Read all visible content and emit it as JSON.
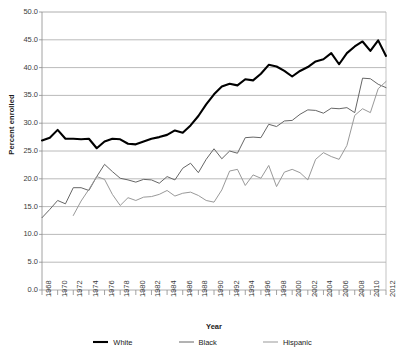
{
  "chart_data": {
    "type": "line",
    "title": "",
    "xlabel": "Year",
    "ylabel": "Percent enrolled",
    "xlim": [
      1968,
      2012
    ],
    "ylim": [
      0.0,
      50.0
    ],
    "ytick_step": 5.0,
    "xtick_step": 1,
    "xlabel_step": 2,
    "grid": "horizontal",
    "legend_position": "bottom",
    "ytick_labels": [
      "50.0",
      "45.0",
      "40.0",
      "35.0",
      "30.0",
      "25.0",
      "20.0",
      "15.0",
      "10.0",
      "5.0",
      "0.0"
    ],
    "xtick_labels": [
      "1968",
      "1970",
      "1972",
      "1974",
      "1976",
      "1978",
      "1980",
      "1982",
      "1984",
      "1986",
      "1988",
      "1990",
      "1992",
      "1994",
      "1996",
      "1998",
      "2000",
      "2002",
      "2004",
      "2006",
      "2008",
      "2010",
      "2012"
    ],
    "x": [
      1968,
      1969,
      1970,
      1971,
      1972,
      1973,
      1974,
      1975,
      1976,
      1977,
      1978,
      1979,
      1980,
      1981,
      1982,
      1983,
      1984,
      1985,
      1986,
      1987,
      1988,
      1989,
      1990,
      1991,
      1992,
      1993,
      1994,
      1995,
      1996,
      1997,
      1998,
      1999,
      2000,
      2001,
      2002,
      2003,
      2004,
      2005,
      2006,
      2007,
      2008,
      2009,
      2010,
      2011,
      2012
    ],
    "series": [
      {
        "name": "White",
        "color": "#000000",
        "width": 2.1,
        "values": [
          26.9,
          27.4,
          28.8,
          27.2,
          27.2,
          27.1,
          27.2,
          25.5,
          26.7,
          27.2,
          27.1,
          26.3,
          26.2,
          26.7,
          27.2,
          27.5,
          27.9,
          28.7,
          28.3,
          29.6,
          31.3,
          33.4,
          35.2,
          36.6,
          37.1,
          36.8,
          37.9,
          37.7,
          38.9,
          40.5,
          40.2,
          39.4,
          38.4,
          39.4,
          40.1,
          41.1,
          41.5,
          42.6,
          40.6,
          42.6,
          43.8,
          44.7,
          43.0,
          44.9,
          42.1
        ]
      },
      {
        "name": "Black",
        "color": "#666666",
        "width": 1.0,
        "values": [
          13.0,
          14.5,
          16.1,
          15.5,
          18.4,
          18.4,
          17.9,
          20.4,
          22.6,
          21.3,
          20.1,
          19.8,
          19.4,
          19.9,
          19.8,
          19.2,
          20.4,
          19.8,
          21.9,
          22.8,
          21.1,
          23.5,
          25.4,
          23.6,
          25.0,
          24.6,
          27.4,
          27.5,
          27.4,
          29.8,
          29.4,
          30.4,
          30.5,
          31.6,
          32.4,
          32.3,
          31.8,
          32.7,
          32.6,
          32.8,
          31.9,
          38.1,
          38.0,
          37.0,
          36.4
        ]
      },
      {
        "name": "Hispanic",
        "color": "#999999",
        "width": 1.0,
        "values": [
          null,
          null,
          null,
          null,
          13.4,
          16.0,
          18.1,
          20.4,
          19.9,
          17.2,
          15.2,
          16.6,
          16.1,
          16.7,
          16.8,
          17.2,
          17.9,
          16.9,
          17.4,
          17.6,
          17.0,
          16.1,
          15.8,
          18.0,
          21.4,
          21.7,
          18.8,
          20.7,
          20.1,
          22.4,
          18.6,
          21.2,
          21.7,
          21.1,
          19.8,
          23.5,
          24.7,
          24.0,
          23.5,
          26.0,
          31.4,
          32.6,
          31.9,
          36.2,
          37.5
        ]
      }
    ]
  },
  "legend": {
    "items": [
      {
        "label": "White"
      },
      {
        "label": "Black"
      },
      {
        "label": "Hispanic"
      }
    ]
  }
}
